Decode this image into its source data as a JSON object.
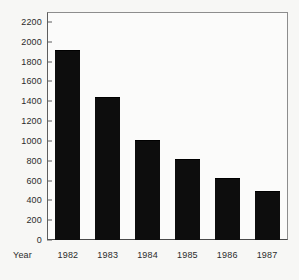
{
  "chart_data": {
    "type": "bar",
    "title": "",
    "subtitle": "",
    "xlabel": "Year",
    "ylabel": "",
    "categories": [
      "1982",
      "1983",
      "1984",
      "1985",
      "1986",
      "1987"
    ],
    "values": [
      1920,
      1440,
      1010,
      815,
      625,
      495
    ],
    "series": [
      {
        "name": "",
        "values": [
          1920,
          1440,
          1010,
          815,
          625,
          495
        ]
      }
    ],
    "ylim": [
      0,
      2300
    ],
    "yticks": [
      0,
      200,
      400,
      600,
      800,
      1000,
      1200,
      1400,
      1600,
      1800,
      2000,
      2200
    ],
    "ytick_labels": [
      "0",
      "200",
      "400",
      "600",
      "800",
      "1000",
      "1200",
      "1400",
      "1600",
      "1800",
      "2000",
      "2200"
    ],
    "grid": false,
    "legend": null,
    "legend_position": "none",
    "bar_color": "#0d0d0d",
    "frame_color": "#5d5d5d",
    "background_color": "#f7f7f5",
    "annotations": []
  }
}
